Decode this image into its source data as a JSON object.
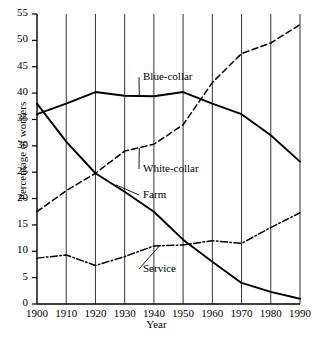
{
  "chart_data": {
    "type": "line",
    "title": "",
    "xlabel": "Year",
    "ylabel": "Percentage of workers",
    "x": [
      1900,
      1910,
      1920,
      1930,
      1940,
      1950,
      1960,
      1970,
      1980,
      1990
    ],
    "xlim": [
      1900,
      1990
    ],
    "ylim": [
      0,
      55
    ],
    "ytick_step": 5,
    "xticks": [
      "1900",
      "1910",
      "1920",
      "1930",
      "1940",
      "1950",
      "1960",
      "1970",
      "1980",
      "1990"
    ],
    "yticks": [
      "0",
      "5",
      "10",
      "15",
      "20",
      "25",
      "30",
      "35",
      "40",
      "45",
      "50",
      "55"
    ],
    "grid": "vertical",
    "legend": "inline-annotations",
    "series": [
      {
        "name": "Blue-collar",
        "style": "solid",
        "values": [
          36,
          38,
          40.2,
          39.5,
          39.4,
          40.2,
          38,
          36,
          32,
          27
        ]
      },
      {
        "name": "White-collar",
        "style": "dashed",
        "values": [
          17.5,
          21.5,
          24.8,
          29,
          30.3,
          34,
          42,
          47.5,
          49.5,
          53
        ]
      },
      {
        "name": "Farm",
        "style": "solid",
        "values": [
          38,
          30.8,
          24.8,
          21.3,
          17.5,
          12.2,
          8,
          4,
          2.3,
          1
        ]
      },
      {
        "name": "Service",
        "style": "dash-dot",
        "values": [
          8.7,
          9.3,
          7.3,
          9,
          11,
          11.2,
          12,
          11.5,
          14.5,
          17.3
        ]
      }
    ],
    "annotations": [
      {
        "label": "Blue-collar",
        "x": 143,
        "y": 70
      },
      {
        "label": "White-collar",
        "x": 143,
        "y": 162
      },
      {
        "label": "Farm",
        "x": 143,
        "y": 188
      },
      {
        "label": "Service",
        "x": 143,
        "y": 262
      }
    ]
  }
}
